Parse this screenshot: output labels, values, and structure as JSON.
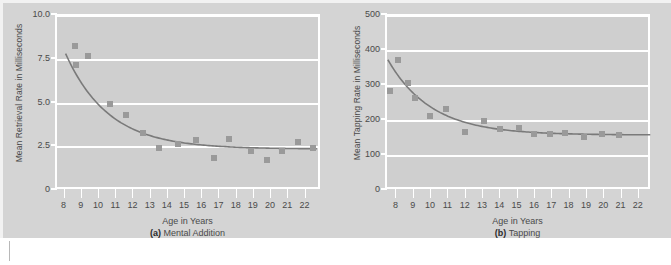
{
  "figure": {
    "background_color": "#d4d4d4",
    "plot_background_color": "#cfcfcf",
    "grid_color": "#ffffff",
    "marker_color": "#9a9a9a",
    "curve_color": "#7a7a7a",
    "text_color": "#4a4a4a"
  },
  "chart_data": [
    {
      "type": "scatter",
      "panel_letter": "(a)",
      "panel_title": "Mental Addition",
      "title": "",
      "xlabel": "Age in Years",
      "ylabel": "Mean Retrieval Rate in Milliseconds",
      "xlim": [
        7.5,
        22.9
      ],
      "ylim": [
        0,
        10.0
      ],
      "xticks": [
        8,
        9,
        10,
        11,
        12,
        13,
        14,
        15,
        16,
        17,
        18,
        19,
        20,
        21,
        22
      ],
      "xtick_labels": [
        "8",
        "9",
        "10",
        "11",
        "12",
        "13",
        "14",
        "15",
        "16",
        "17",
        "18",
        "19",
        "20",
        "21",
        "22"
      ],
      "yticks": [
        0,
        2.5,
        5.0,
        7.5,
        10.0
      ],
      "ytick_labels": [
        "0",
        "2.5",
        "5.0",
        "7.5",
        "10.0"
      ],
      "grid": true,
      "legend": "none",
      "x": [
        8.55,
        8.6,
        9.3,
        10.6,
        11.5,
        12.5,
        13.4,
        14.55,
        15.6,
        16.6,
        17.5,
        18.8,
        19.7,
        20.6,
        21.5,
        22.4
      ],
      "y": [
        8.3,
        7.2,
        7.7,
        4.95,
        4.35,
        3.3,
        2.45,
        2.7,
        2.9,
        1.9,
        3.0,
        2.3,
        1.75,
        2.3,
        2.8,
        2.45
      ],
      "fit_curve": {
        "description": "decreasing power/exponential fit asymptoting near 2.4",
        "x_start": 8.0,
        "x_end": 22.6,
        "y_start": 7.85,
        "y_asymptote": 2.4
      }
    },
    {
      "type": "scatter",
      "panel_letter": "(b)",
      "panel_title": "Tapping",
      "title": "",
      "xlabel": "Age in Years",
      "ylabel": "Mean Tapping Rate in Milliseconds",
      "xlim": [
        7.4,
        22.7
      ],
      "ylim": [
        0,
        500
      ],
      "xticks": [
        8,
        9,
        10,
        11,
        12,
        13,
        14,
        15,
        16,
        17,
        18,
        19,
        20,
        21,
        22
      ],
      "xtick_labels": [
        "8",
        "9",
        "10",
        "11",
        "12",
        "13",
        "14",
        "15",
        "16",
        "17",
        "18",
        "19",
        "20",
        "21",
        "22"
      ],
      "yticks": [
        0,
        100,
        200,
        300,
        400,
        500
      ],
      "ytick_labels": [
        "0",
        "100",
        "200",
        "300",
        "400",
        "500"
      ],
      "grid": true,
      "legend": "none",
      "x": [
        7.6,
        8.05,
        8.6,
        9.0,
        9.9,
        10.8,
        11.9,
        13.0,
        13.9,
        15.0,
        15.9,
        16.8,
        17.7,
        18.8,
        19.8,
        20.8
      ],
      "y": [
        287,
        373,
        310,
        265,
        215,
        233,
        170,
        201,
        177,
        180,
        162,
        162,
        165,
        155,
        162,
        161
      ],
      "fit_curve": {
        "description": "decreasing exponential fit asymptoting near 160",
        "x_start": 7.45,
        "x_end": 22.6,
        "y_start": 375,
        "y_asymptote": 160
      }
    }
  ]
}
